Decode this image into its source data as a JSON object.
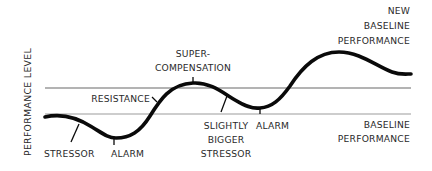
{
  "diagram": {
    "type": "supercompensation-curve",
    "y_axis_label": "PERFORMANCE LEVEL",
    "colors": {
      "curve": "#0a0a0a",
      "new_baseline_line": "#9a9a9a",
      "baseline_line": "#bdbdbd",
      "text": "#2a2a2a",
      "background": "#ffffff"
    },
    "reference_lines": [
      {
        "id": "new-baseline",
        "label_lines": [
          "NEW",
          "BASELINE",
          "PERFORMANCE"
        ]
      },
      {
        "id": "baseline",
        "label_lines": [
          "BASELINE",
          "PERFORMANCE"
        ]
      }
    ],
    "annotations": {
      "stressor": "STRESSOR",
      "alarm_1": "ALARM",
      "resistance": "RESISTANCE",
      "supercompensation_line1": "SUPER-",
      "supercompensation_line2": "COMPENSATION",
      "bigger_stressor_line1": "SLIGHTLY",
      "bigger_stressor_line2": "BIGGER",
      "bigger_stressor_line3": "STRESSOR",
      "alarm_2": "ALARM",
      "new_baseline_line1": "NEW",
      "new_baseline_line2": "BASELINE",
      "new_baseline_line3": "PERFORMANCE",
      "baseline_line1": "BASELINE",
      "baseline_line2": "PERFORMANCE"
    },
    "phases": [
      "STRESSOR",
      "ALARM",
      "RESISTANCE",
      "SUPER-COMPENSATION",
      "SLIGHTLY BIGGER STRESSOR",
      "ALARM",
      "NEW BASELINE PERFORMANCE"
    ]
  }
}
